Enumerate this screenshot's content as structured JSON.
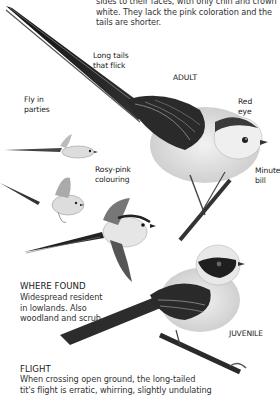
{
  "intro_text": {
    "line1": "sides to their faces, with only chin and crown",
    "line2": "white. They lack the pink coloration and the",
    "line3": "tails are shorter."
  },
  "labels": {
    "long_tails": [
      "Long tails",
      "that flick"
    ],
    "adult": "ADULT",
    "red_eye": [
      "Red",
      "eye"
    ],
    "fly_in_parties": [
      "Fly in",
      "parties"
    ],
    "rosy_pink": [
      "Rosy-pink",
      "colouring"
    ],
    "minute_bill": [
      "Minute",
      "bill"
    ],
    "juvenile": "JUVENILE"
  },
  "where_found": {
    "heading": "WHERE FOUND",
    "lines": [
      "Widespread resident",
      "in lowlands. Also",
      "woodland and scrub."
    ]
  },
  "flight": {
    "heading": "FLIGHT",
    "lines": [
      "When crossing open ground, the long-tailed",
      "tit's flight is erratic, whirring, slightly undulating"
    ]
  },
  "illustrations": [
    {
      "name": "adult-long-tailed-tit-perched"
    },
    {
      "name": "long-tailed-tit-flying-small-1"
    },
    {
      "name": "long-tailed-tit-flying-small-2"
    },
    {
      "name": "long-tailed-tit-flying-large"
    },
    {
      "name": "juvenile-long-tailed-tit-perched"
    }
  ]
}
